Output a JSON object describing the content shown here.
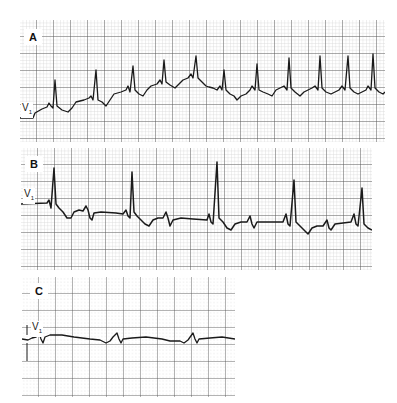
{
  "figure": {
    "panels": [
      {
        "id": "A",
        "label": "A",
        "lead": "V",
        "lead_sub": "1",
        "box": {
          "x": 20,
          "y": 20,
          "w": 365,
          "h": 122
        }
      },
      {
        "id": "B",
        "label": "B",
        "lead": "V",
        "lead_sub": "1",
        "box": {
          "x": 21,
          "y": 148,
          "w": 351,
          "h": 122
        }
      },
      {
        "id": "C",
        "label": "C",
        "lead": "V",
        "lead_sub": "1",
        "box": {
          "x": 22,
          "y": 277,
          "w": 213,
          "h": 120
        }
      }
    ],
    "colors": {
      "grid_major": "#555555",
      "grid_minor": "#bdbdbd",
      "trace": "#1a1a1a",
      "paper": "#ffffff"
    }
  }
}
